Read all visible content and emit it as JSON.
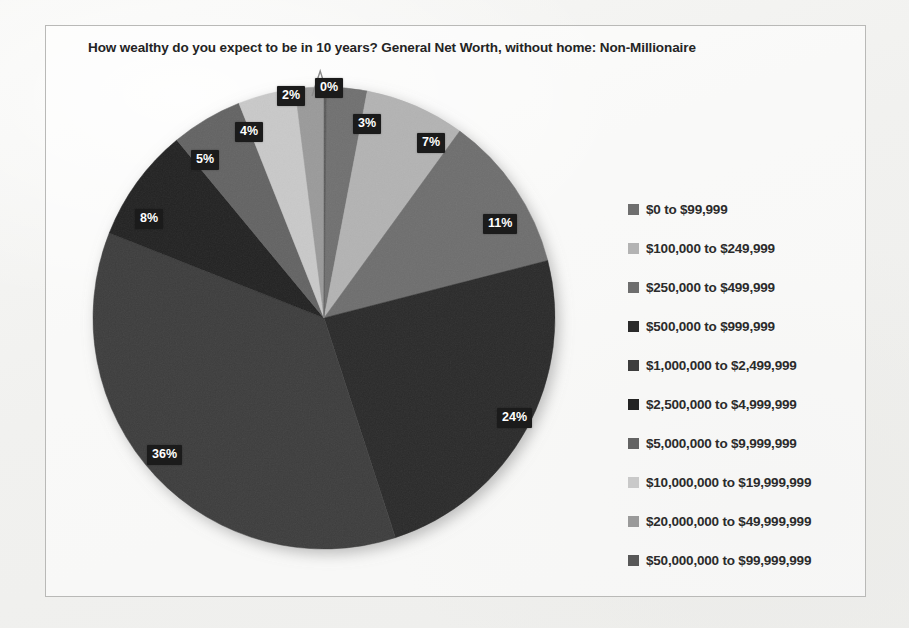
{
  "chart_data": {
    "type": "pie",
    "title": "How wealthy do you expect to be in 10 years? General Net Worth, without home: Non-Millionaire",
    "xlabel": "",
    "ylabel": "",
    "legend_position": "right",
    "grid": false,
    "start_angle_deg": 0,
    "direction": "clockwise",
    "categories": [
      "$0 to $99,999",
      "$100,000 to $249,999",
      "$250,000 to $499,999",
      "$500,000 to $999,999",
      "$1,000,000 to $2,499,999",
      "$2,500,000 to $4,999,999",
      "$5,000,000 to $9,999,999",
      "$10,000,000 to $19,999,999",
      "$20,000,000 to $49,999,999",
      "$50,000,000 to $99,999,999"
    ],
    "values": [
      3,
      7,
      11,
      24,
      36,
      8,
      5,
      4,
      2,
      0
    ],
    "data_labels": [
      "3%",
      "7%",
      "11%",
      "24%",
      "36%",
      "8%",
      "5%",
      "4%",
      "2%",
      "0%"
    ],
    "colors": [
      "#6f6f6f",
      "#b3b3b3",
      "#6e6e6e",
      "#2b2b2b",
      "#3d3d3d",
      "#232323",
      "#636363",
      "#c9c9c9",
      "#9a9a9a",
      "#585858"
    ]
  },
  "legend": {
    "items": [
      {
        "label": "$0 to $99,999",
        "color": "#6f6f6f"
      },
      {
        "label": "$100,000 to $249,999",
        "color": "#b3b3b3"
      },
      {
        "label": "$250,000 to $499,999",
        "color": "#6e6e6e"
      },
      {
        "label": "$500,000 to $999,999",
        "color": "#2b2b2b"
      },
      {
        "label": "$1,000,000 to $2,499,999",
        "color": "#3d3d3d"
      },
      {
        "label": "$2,500,000 to $4,999,999",
        "color": "#232323"
      },
      {
        "label": "$5,000,000 to $9,999,999",
        "color": "#636363"
      },
      {
        "label": "$10,000,000 to $19,999,999",
        "color": "#c9c9c9"
      },
      {
        "label": "$20,000,000 to $49,999,999",
        "color": "#9a9a9a"
      },
      {
        "label": "$50,000,000 to $99,999,999",
        "color": "#585858"
      }
    ]
  },
  "labels": {
    "l0": "3%",
    "l1": "7%",
    "l2": "11%",
    "l3": "24%",
    "l4": "36%",
    "l5": "8%",
    "l6": "5%",
    "l7": "4%",
    "l8": "2%",
    "l9": "0%"
  }
}
